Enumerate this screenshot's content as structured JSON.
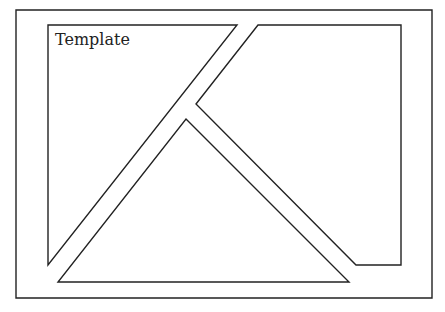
{
  "title": "Template",
  "colors": {
    "stroke": "#222222",
    "background": "#ffffff"
  },
  "shapes": {
    "outer_frame": "16,10 432,10 432,298 16,298",
    "left_panel": "48,25 237,25 48,265",
    "right_panel": "258,25 401,25 401,265 356,265 196,104",
    "bottom_triangle": "186,119 349,282 58,282"
  }
}
